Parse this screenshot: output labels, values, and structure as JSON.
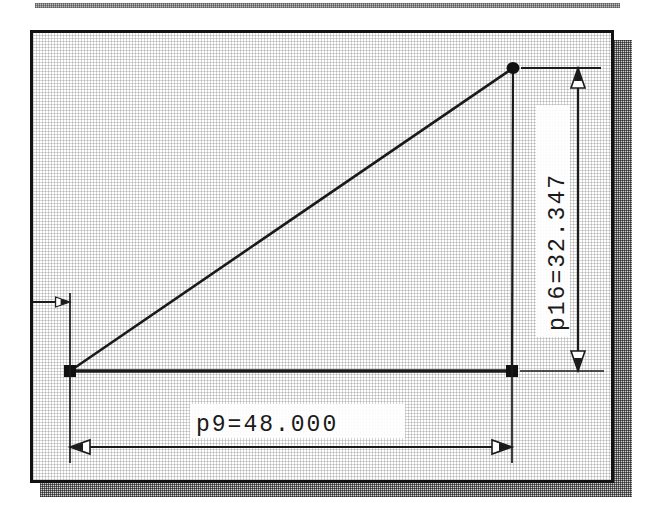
{
  "drawing": {
    "title": "Parametric right triangle dimension sketch",
    "background_color": "#ffffff",
    "line_color": "#1a1a1a",
    "frame_color": "#121212",
    "shadow_color": "#6f6f6f",
    "dimensions": [
      {
        "id": "horizontal-dimension",
        "label": "p9=48.000",
        "parameter": "p9",
        "value": "48.000",
        "orientation": "horizontal",
        "arrow_style": "hollow-triangle",
        "arrows": [
          "left",
          "right"
        ]
      },
      {
        "id": "vertical-dimension",
        "label": "p16=32.347",
        "parameter": "p16",
        "value": "32.347",
        "orientation": "vertical-rotated-90",
        "arrow_style": "hollow-triangle",
        "arrows": [
          "up",
          "down"
        ]
      }
    ],
    "geometry": {
      "type": "right-triangle",
      "vertices": [
        {
          "name": "origin-vertex",
          "x": 70,
          "y": 371,
          "marker": "square-filled"
        },
        {
          "name": "bottom-right-vertex",
          "x": 512,
          "y": 371,
          "marker": "square-filled"
        },
        {
          "name": "apex-vertex",
          "x": 513,
          "y": 68,
          "marker": "square-filled"
        }
      ],
      "edges": [
        {
          "name": "base-edge",
          "from": "origin-vertex",
          "to": "bottom-right-vertex"
        },
        {
          "name": "hypotenuse-edge",
          "from": "origin-vertex",
          "to": "apex-vertex"
        }
      ]
    },
    "annotations": [
      {
        "id": "angle-marker",
        "description": "small right-pointing arrow leader at the left vertical extension line",
        "arrow_direction": "right"
      }
    ]
  }
}
